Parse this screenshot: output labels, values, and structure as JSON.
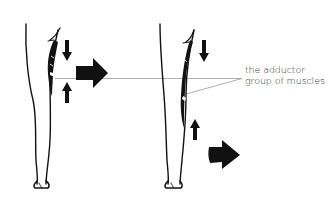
{
  "figure": {
    "label_lines": [
      "the adductor",
      "group of muscles"
    ],
    "colors": {
      "ink": "#111111",
      "leader_line": "#9a9a9a",
      "label_text": "#333333",
      "background": "#ffffff"
    },
    "legs": [
      {
        "name": "left-leg",
        "state": "contracted",
        "arrows": [
          "down-arrow",
          "up-arrow",
          "right-arrow"
        ]
      },
      {
        "name": "right-leg",
        "state": "extended",
        "arrows": [
          "down-arrow",
          "up-arrow",
          "right-arrow"
        ]
      }
    ]
  }
}
